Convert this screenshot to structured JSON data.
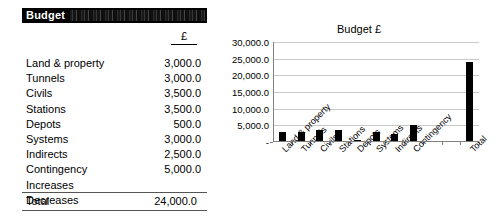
{
  "budget_table": {
    "header_title": "Budget",
    "header_obscured_text": "",
    "currency_header": "£",
    "rows": [
      {
        "label": "Land & property",
        "value": "3,000.0"
      },
      {
        "label": "Tunnels",
        "value": "3,000.0"
      },
      {
        "label": "Civils",
        "value": "3,500.0"
      },
      {
        "label": "Stations",
        "value": "3,500.0"
      },
      {
        "label": "Depots",
        "value": "500.0"
      },
      {
        "label": "Systems",
        "value": "3,000.0"
      },
      {
        "label": "Indirects",
        "value": "2,500.0"
      },
      {
        "label": "Contingency",
        "value": "5,000.0"
      },
      {
        "label": "Increases",
        "value": ""
      },
      {
        "label": "Decreases",
        "value": ""
      }
    ],
    "total": {
      "label": "Total",
      "value": "24,000.0"
    }
  },
  "chart_data": {
    "type": "bar",
    "title": "Budget £",
    "xlabel": "",
    "ylabel": "",
    "categories": [
      "Land & property",
      "Tunnels",
      "Civils",
      "Stations",
      "Depots",
      "Systems",
      "Indirects",
      "Contingency",
      "Increases",
      "Decreases",
      "Total"
    ],
    "values": [
      3000,
      3000,
      3500,
      3500,
      500,
      3000,
      2500,
      5000,
      0,
      0,
      24000
    ],
    "visible_tick_labels": [
      "Land & property",
      "Tunnels",
      "Civils",
      "Stations",
      "Depots",
      "Systems",
      "Indirects",
      "Contingency",
      "",
      "",
      "Total"
    ],
    "ylim": [
      0,
      30000
    ],
    "ytick_labels": [
      "-",
      "5,000.0",
      "10,000.0",
      "15,000.0",
      "20,000.0",
      "25,000.0",
      "30,000.0"
    ],
    "ytick_values": [
      0,
      5000,
      10000,
      15000,
      20000,
      25000,
      30000
    ],
    "grid": true,
    "legend": false,
    "bar_color": "#000000",
    "grid_color": "#C8C8C8",
    "axis_color": "#808080"
  }
}
